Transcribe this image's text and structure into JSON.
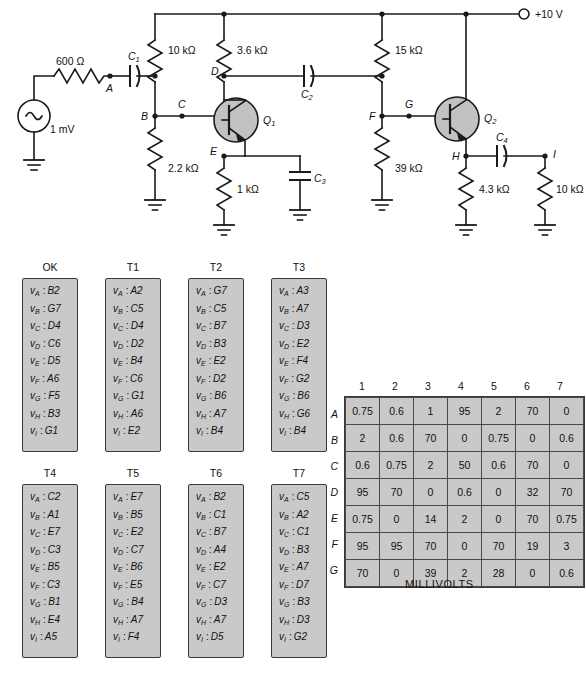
{
  "circuit": {
    "source_label": "1 mV",
    "supply_label": "+10 V",
    "resistors": {
      "r_source": "600 Ω",
      "r_b1_q1": "10 kΩ",
      "r_c_q1": "3.6 kΩ",
      "r_b2_q1": "2.2 kΩ",
      "r_e_q1": "1 kΩ",
      "r_b1_q2": "15 kΩ",
      "r_b2_q2": "39 kΩ",
      "r_e_q2": "4.3 kΩ",
      "r_load": "10 kΩ"
    },
    "capacitors": {
      "c1_name": "C",
      "c1_sub": "1",
      "c2_name": "C",
      "c2_sub": "2",
      "c3_name": "C",
      "c3_sub": "3",
      "c4_name": "C",
      "c4_sub": "4"
    },
    "transistors": {
      "q1_name": "Q",
      "q1_sub": "1",
      "q2_name": "Q",
      "q2_sub": "2"
    },
    "nodes": [
      "A",
      "B",
      "C",
      "D",
      "E",
      "F",
      "G",
      "H",
      "I"
    ]
  },
  "test_columns": [
    {
      "title": "OK",
      "rows": [
        {
          "node": "A",
          "value": "B2"
        },
        {
          "node": "B",
          "value": "G7"
        },
        {
          "node": "C",
          "value": "D4"
        },
        {
          "node": "D",
          "value": "C6"
        },
        {
          "node": "E",
          "value": "D5"
        },
        {
          "node": "F",
          "value": "A6"
        },
        {
          "node": "G",
          "value": "F5"
        },
        {
          "node": "H",
          "value": "B3"
        },
        {
          "node": "I",
          "value": "G1"
        }
      ]
    },
    {
      "title": "T1",
      "rows": [
        {
          "node": "A",
          "value": "A2"
        },
        {
          "node": "B",
          "value": "C5"
        },
        {
          "node": "C",
          "value": "D4"
        },
        {
          "node": "D",
          "value": "D2"
        },
        {
          "node": "E",
          "value": "B4"
        },
        {
          "node": "F",
          "value": "C6"
        },
        {
          "node": "G",
          "value": "G1"
        },
        {
          "node": "H",
          "value": "A6"
        },
        {
          "node": "I",
          "value": "E2"
        }
      ]
    },
    {
      "title": "T2",
      "rows": [
        {
          "node": "A",
          "value": "G7"
        },
        {
          "node": "B",
          "value": "C5"
        },
        {
          "node": "C",
          "value": "B7"
        },
        {
          "node": "D",
          "value": "B3"
        },
        {
          "node": "E",
          "value": "E2"
        },
        {
          "node": "F",
          "value": "D2"
        },
        {
          "node": "G",
          "value": "B6"
        },
        {
          "node": "H",
          "value": "A7"
        },
        {
          "node": "I",
          "value": "B4"
        }
      ]
    },
    {
      "title": "T3",
      "rows": [
        {
          "node": "A",
          "value": "A3"
        },
        {
          "node": "B",
          "value": "A7"
        },
        {
          "node": "C",
          "value": "D3"
        },
        {
          "node": "D",
          "value": "E2"
        },
        {
          "node": "E",
          "value": "F4"
        },
        {
          "node": "F",
          "value": "G2"
        },
        {
          "node": "G",
          "value": "B6"
        },
        {
          "node": "H",
          "value": "G6"
        },
        {
          "node": "I",
          "value": "B4"
        }
      ]
    },
    {
      "title": "T4",
      "rows": [
        {
          "node": "A",
          "value": "C2"
        },
        {
          "node": "B",
          "value": "A1"
        },
        {
          "node": "C",
          "value": "E7"
        },
        {
          "node": "D",
          "value": "C3"
        },
        {
          "node": "E",
          "value": "B5"
        },
        {
          "node": "F",
          "value": "C3"
        },
        {
          "node": "G",
          "value": "B1"
        },
        {
          "node": "H",
          "value": "E4"
        },
        {
          "node": "I",
          "value": "A5"
        }
      ]
    },
    {
      "title": "T5",
      "rows": [
        {
          "node": "A",
          "value": "E7"
        },
        {
          "node": "B",
          "value": "B5"
        },
        {
          "node": "C",
          "value": "E2"
        },
        {
          "node": "D",
          "value": "C7"
        },
        {
          "node": "E",
          "value": "B6"
        },
        {
          "node": "F",
          "value": "E5"
        },
        {
          "node": "G",
          "value": "B4"
        },
        {
          "node": "H",
          "value": "A7"
        },
        {
          "node": "I",
          "value": "F4"
        }
      ]
    },
    {
      "title": "T6",
      "rows": [
        {
          "node": "A",
          "value": "B2"
        },
        {
          "node": "B",
          "value": "C1"
        },
        {
          "node": "C",
          "value": "B7"
        },
        {
          "node": "D",
          "value": "A4"
        },
        {
          "node": "E",
          "value": "E2"
        },
        {
          "node": "F",
          "value": "C7"
        },
        {
          "node": "G",
          "value": "D3"
        },
        {
          "node": "H",
          "value": "A7"
        },
        {
          "node": "I",
          "value": "D5"
        }
      ]
    },
    {
      "title": "T7",
      "rows": [
        {
          "node": "A",
          "value": "C5"
        },
        {
          "node": "B",
          "value": "A2"
        },
        {
          "node": "C",
          "value": "C1"
        },
        {
          "node": "D",
          "value": "B3"
        },
        {
          "node": "E",
          "value": "A7"
        },
        {
          "node": "F",
          "value": "D7"
        },
        {
          "node": "G",
          "value": "B3"
        },
        {
          "node": "H",
          "value": "D3"
        },
        {
          "node": "I",
          "value": "G2"
        }
      ]
    }
  ],
  "millivolt_table": {
    "caption": "MILLIVOLTS",
    "col_headers": [
      "1",
      "2",
      "3",
      "4",
      "5",
      "6",
      "7"
    ],
    "row_headers": [
      "A",
      "B",
      "C",
      "D",
      "E",
      "F",
      "G"
    ],
    "rows": [
      [
        "0.75",
        "0.6",
        "1",
        "95",
        "2",
        "70",
        "0"
      ],
      [
        "2",
        "0.6",
        "70",
        "0",
        "0.75",
        "0",
        "0.6"
      ],
      [
        "0.6",
        "0.75",
        "2",
        "50",
        "0.6",
        "70",
        "0"
      ],
      [
        "95",
        "70",
        "0",
        "0.6",
        "0",
        "32",
        "70"
      ],
      [
        "0.75",
        "0",
        "14",
        "2",
        "0",
        "70",
        "0.75"
      ],
      [
        "95",
        "95",
        "70",
        "0",
        "70",
        "19",
        "3"
      ],
      [
        "70",
        "0",
        "39",
        "2",
        "28",
        "0",
        "0.6"
      ]
    ]
  }
}
